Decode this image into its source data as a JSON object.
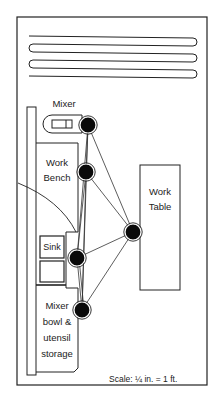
{
  "diagram": {
    "type": "kitchen-floor-plan-work-flow",
    "stations": [
      {
        "id": "mixer",
        "label": "Mixer"
      },
      {
        "id": "work-bench",
        "label_lines": [
          "Work",
          "Bench"
        ]
      },
      {
        "id": "work-table",
        "label_lines": [
          "Work",
          "Table"
        ]
      },
      {
        "id": "sink",
        "label": "Sink"
      },
      {
        "id": "mixer-bowl-storage",
        "label_lines": [
          "Mixer",
          "bowl &",
          "utensil",
          "storage"
        ]
      }
    ],
    "scale_text": "Scale:  ¼ in. = 1 ft.",
    "colors": {
      "line": "#222222",
      "node_fill": "#0a0a0a",
      "background": "#ffffff"
    }
  }
}
